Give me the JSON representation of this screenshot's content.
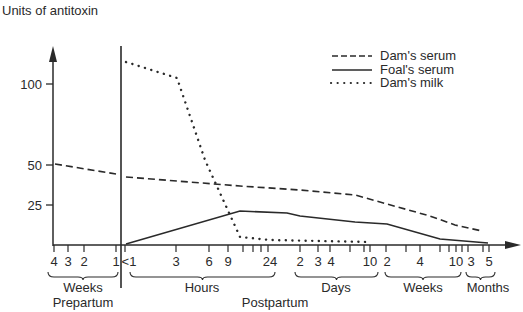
{
  "chart_data": {
    "type": "line",
    "title": "",
    "ylabel": "Units of antitoxin",
    "xlabel": "",
    "ylim": [
      0,
      120
    ],
    "y_ticks": [
      25,
      50,
      75,
      100
    ],
    "grid": false,
    "legend_position": "top-right",
    "x_groups": [
      {
        "label": "Weeks",
        "period": "Prepartum",
        "ticks": [
          "4",
          "3",
          "2",
          "1"
        ]
      },
      {
        "label": "Hours",
        "period": "Postpartum",
        "ticks": [
          "<1",
          "3",
          "6",
          "9",
          "24"
        ]
      },
      {
        "label": "Days",
        "period": "Postpartum",
        "ticks": [
          "2",
          "3",
          "4",
          "10"
        ]
      },
      {
        "label": "Weeks",
        "period": "Postpartum",
        "ticks": [
          "2",
          "4",
          "10"
        ]
      },
      {
        "label": "Months",
        "period": "Postpartum",
        "ticks": [
          "3",
          "5"
        ]
      }
    ],
    "period_labels": [
      "Prepartum",
      "Postpartum"
    ],
    "series": [
      {
        "name": "Dam's serum",
        "style": "dashed",
        "points": [
          {
            "x": "4 weeks prepartum",
            "y": 50
          },
          {
            "x": "1 week prepartum",
            "y": 44
          },
          {
            "x": "<1 hour",
            "y": 42
          },
          {
            "x": "9 hours",
            "y": 37
          },
          {
            "x": "2 days",
            "y": 34
          },
          {
            "x": "10 days",
            "y": 31
          },
          {
            "x": "2 weeks",
            "y": 25
          },
          {
            "x": "6 weeks",
            "y": 18
          },
          {
            "x": "10 weeks",
            "y": 12
          },
          {
            "x": "5 months",
            "y": 8
          }
        ]
      },
      {
        "name": "Foal's serum",
        "style": "solid",
        "points": [
          {
            "x": "<1 hour",
            "y": 0
          },
          {
            "x": "9 hours",
            "y": 21
          },
          {
            "x": "24 hours",
            "y": 20
          },
          {
            "x": "2 days",
            "y": 18
          },
          {
            "x": "10 days",
            "y": 14
          },
          {
            "x": "2 weeks",
            "y": 13
          },
          {
            "x": "8 weeks",
            "y": 4
          },
          {
            "x": "5 months",
            "y": 1
          }
        ]
      },
      {
        "name": "Dam's milk",
        "style": "dotted",
        "points": [
          {
            "x": "<1 hour",
            "y": 114
          },
          {
            "x": "3 hours",
            "y": 104
          },
          {
            "x": "6 hours",
            "y": 53
          },
          {
            "x": "9 hours",
            "y": 5
          },
          {
            "x": "24 hours",
            "y": 3
          },
          {
            "x": "10 days",
            "y": 2
          }
        ]
      }
    ]
  },
  "render": {
    "y_axis_label": "Units of antitoxin",
    "y_ticks": [
      {
        "label": "100",
        "y": 84
      },
      {
        "label": "50",
        "y": 165
      },
      {
        "label": "25",
        "y": 205
      }
    ],
    "x_ticks_labeled": [
      {
        "label": "4",
        "x": 54
      },
      {
        "label": "3",
        "x": 68
      },
      {
        "label": "2",
        "x": 84
      },
      {
        "label": "1",
        "x": 116
      },
      {
        "label": "<1",
        "x": 129
      },
      {
        "label": "3",
        "x": 176
      },
      {
        "label": "6",
        "x": 209
      },
      {
        "label": "9",
        "x": 228
      },
      {
        "label": "24",
        "x": 270
      },
      {
        "label": "2",
        "x": 300
      },
      {
        "label": "3",
        "x": 318
      },
      {
        "label": "4",
        "x": 331
      },
      {
        "label": "10",
        "x": 370
      },
      {
        "label": "2",
        "x": 387
      },
      {
        "label": "4",
        "x": 420
      },
      {
        "label": "10",
        "x": 456
      },
      {
        "label": "3",
        "x": 471
      },
      {
        "label": "5",
        "x": 489
      }
    ],
    "x_tick_marks": [
      54,
      68,
      84,
      116,
      125,
      176,
      209,
      228,
      243,
      253,
      261,
      268,
      300,
      318,
      330,
      350,
      364,
      370,
      386,
      406,
      420,
      440,
      449,
      456,
      462,
      468,
      483,
      489
    ],
    "groups": [
      {
        "label": "Weeks",
        "x1": 48,
        "x2": 118,
        "cx": 83
      },
      {
        "label": "Hours",
        "x1": 130,
        "x2": 275,
        "cx": 202
      },
      {
        "label": "Days",
        "x1": 295,
        "x2": 378,
        "cx": 336
      },
      {
        "label": "Weeks",
        "x1": 385,
        "x2": 461,
        "cx": 423
      },
      {
        "label": "Months",
        "x1": 466,
        "x2": 495,
        "cx": 488
      }
    ],
    "periods": [
      {
        "label": "Prepartum",
        "x": 83
      },
      {
        "label": "Postpartum",
        "x": 275
      }
    ],
    "legend": [
      {
        "label": "Dam's serum",
        "style": "dashed"
      },
      {
        "label": "Foal's serum",
        "style": "solid"
      },
      {
        "label": "Dam's milk",
        "style": "dotted"
      }
    ],
    "paths": {
      "dams_serum_pre": "M55,164 L116,174",
      "dams_serum_post": "M126,177 L240,186 L300,190 L355,195 L387,204 L430,216 L455,225 L482,231",
      "foals_serum": "M126,244 L240,211 L287,213 L300,216 L355,222 L387,224 L440,239 L488,243",
      "dams_milk": "M126,62 L177,78 L205,160 L240,237 L270,240 L370,242"
    },
    "line_color": "#2a2a2a"
  }
}
